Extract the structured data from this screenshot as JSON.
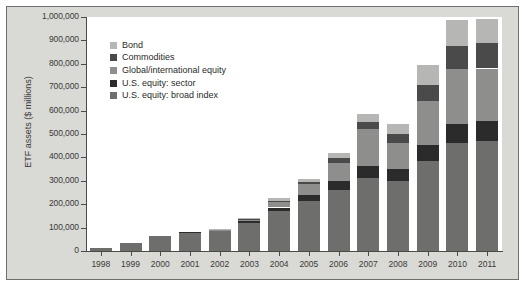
{
  "chart_data": {
    "type": "bar",
    "subtype": "stacked-bar",
    "title": "",
    "xlabel": "",
    "ylabel": "ETF assets ($ millions)",
    "ylim": [
      0,
      1000000
    ],
    "ytick_step": 100000,
    "grid": false,
    "legend_position": "upper-left-inside",
    "categories": [
      "1998",
      "1999",
      "2000",
      "2001",
      "2002",
      "2003",
      "2004",
      "2005",
      "2006",
      "2007",
      "2008",
      "2009",
      "2010",
      "2011"
    ],
    "ytick_labels": [
      "1,000,000",
      "900,000",
      "800,000",
      "700,000",
      "600,000",
      "500,000",
      "400,000",
      "300,000",
      "200,000",
      "100,000",
      "0"
    ],
    "ytick_values": [
      1000000,
      900000,
      800000,
      700000,
      600000,
      500000,
      400000,
      300000,
      200000,
      100000,
      0
    ],
    "series": [
      {
        "name": "U.S. equity: broad index",
        "color": "#6e6e6c",
        "values": [
          15000,
          33000,
          65000,
          79000,
          89000,
          120000,
          170000,
          215000,
          260000,
          310000,
          300000,
          385000,
          460000,
          470000
        ]
      },
      {
        "name": "U.S. equity: sector",
        "color": "#2b2b2b",
        "values": [
          0,
          0,
          0,
          1000,
          2000,
          8000,
          16000,
          25000,
          38000,
          55000,
          52000,
          70000,
          83000,
          85000
        ]
      },
      {
        "name": "Global/international equity",
        "color": "#8e8e8c",
        "values": [
          0,
          0,
          0,
          0,
          1000,
          6000,
          25000,
          45000,
          80000,
          155000,
          110000,
          185000,
          235000,
          225000
        ]
      },
      {
        "name": "Commodities",
        "color": "#4a4a4a",
        "values": [
          0,
          0,
          0,
          0,
          0,
          1000,
          4000,
          8000,
          18000,
          30000,
          40000,
          70000,
          100000,
          110000
        ]
      },
      {
        "name": "Bond",
        "color": "#b6b6b4",
        "values": [
          0,
          0,
          0,
          0,
          2000,
          5000,
          10000,
          15000,
          22000,
          35000,
          40000,
          85000,
          110000,
          100000
        ]
      }
    ],
    "totals": [
      15000,
      33000,
      65000,
      80000,
      94000,
      140000,
      225000,
      308000,
      418000,
      585000,
      542000,
      795000,
      988000,
      990000
    ],
    "legend_order_top_to_bottom": [
      "Bond",
      "Commodities",
      "Global/international equity",
      "U.S. equity: sector",
      "U.S. equity: broad index"
    ]
  },
  "legend": {
    "items": [
      {
        "label": "Bond",
        "color": "#b6b6b4"
      },
      {
        "label": "Commodities",
        "color": "#4a4a4a"
      },
      {
        "label": "Global/international equity",
        "color": "#8e8e8c"
      },
      {
        "label": "U.S. equity: sector",
        "color": "#2b2b2b"
      },
      {
        "label": "U.S. equity: broad index",
        "color": "#6e6e6c"
      }
    ]
  },
  "colors": {
    "figure_background": "#d9d9d5",
    "figure_border": "#6f6f6d",
    "plot_background": "#ffffff",
    "axis": "#4a4a48",
    "text": "#3a3a38"
  }
}
